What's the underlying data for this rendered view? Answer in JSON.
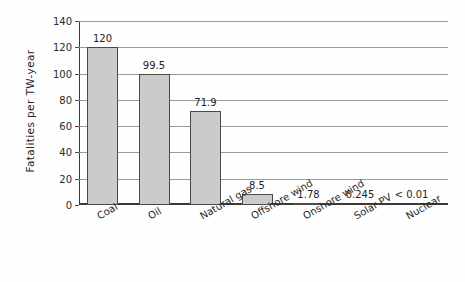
{
  "chart_data": {
    "type": "bar",
    "title": "",
    "subtitle": "",
    "xlabel": "",
    "ylabel": "Fatalities per TW-year",
    "categories": [
      "Coal",
      "Oil",
      "Natural gas",
      "Offshore wind",
      "Onshore wind",
      "Solar PV",
      "Nuclear"
    ],
    "values": [
      120,
      99.5,
      71.9,
      8.5,
      1.78,
      0.245,
      0.01
    ],
    "value_labels": [
      "120",
      "99.5",
      "71.9",
      "8.5",
      "1.78",
      "0.245",
      "< 0.01"
    ],
    "ylim": [
      0,
      140
    ],
    "ytick_labels": [
      "0",
      "20",
      "40",
      "60",
      "80",
      "100",
      "120",
      "140"
    ],
    "ytick_values": [
      0,
      20,
      40,
      60,
      80,
      100,
      120,
      140
    ],
    "grid": true,
    "legend": null,
    "legend_position": "none",
    "bar_fill_color": "#cbcbcb",
    "bar_edge_color": "#4a4a4a",
    "axis_color": "#3a3a3a",
    "gridline_color": "#9a9a9a",
    "background_color": "#fefefe",
    "xtick_label_rotation": -30
  }
}
